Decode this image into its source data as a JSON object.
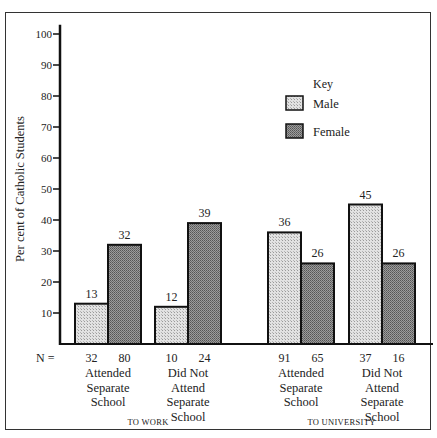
{
  "chart_data": {
    "type": "bar",
    "ylabel": "Per cent of Catholic Students",
    "ylim": [
      0,
      100
    ],
    "yticks": [
      10,
      20,
      30,
      40,
      50,
      60,
      70,
      80,
      90,
      100
    ],
    "legend": {
      "title": "Key",
      "position": "upper right",
      "entries": [
        "Male",
        "Female"
      ]
    },
    "n_label": "N =",
    "groups": [
      {
        "name": "TO WORK",
        "categories": [
          {
            "label": [
              "Attended",
              "Separate",
              "School"
            ],
            "male": 13,
            "female": 32,
            "n_male": 32,
            "n_female": 80
          },
          {
            "label": [
              "Did Not",
              "Attend",
              "Separate",
              "School"
            ],
            "male": 12,
            "female": 39,
            "n_male": 10,
            "n_female": 24
          }
        ]
      },
      {
        "name": "TO UNIVERSITY",
        "categories": [
          {
            "label": [
              "Attended",
              "Separate",
              "School"
            ],
            "male": 36,
            "female": 26,
            "n_male": 91,
            "n_female": 65
          },
          {
            "label": [
              "Did Not",
              "Attend",
              "Separate",
              "School"
            ],
            "male": 45,
            "female": 26,
            "n_male": 37,
            "n_female": 16
          }
        ]
      }
    ],
    "series": [
      {
        "name": "Male",
        "values": [
          13,
          12,
          36,
          45
        ]
      },
      {
        "name": "Female",
        "values": [
          32,
          39,
          26,
          26
        ]
      }
    ]
  },
  "colors": {
    "male": "#d4d4d4",
    "female": "#8a8a8a",
    "axis": "#111111"
  }
}
